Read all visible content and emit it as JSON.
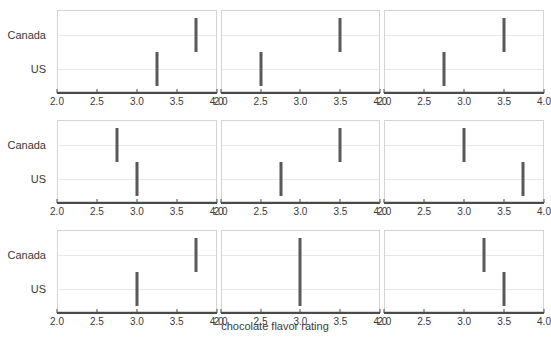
{
  "chart_data": {
    "type": "scatter",
    "title": "",
    "subtitle": "",
    "xlabel": "chocolate flavor rating",
    "ylabel": "",
    "xlim": [
      2.0,
      4.0
    ],
    "xticks": [
      2.0,
      2.5,
      3.0,
      3.5,
      4.0
    ],
    "xtick_labels": [
      "2.0",
      "2.5",
      "3.0",
      "3.5",
      "4.0"
    ],
    "categories": [
      "Canada",
      "US"
    ],
    "grid": true,
    "legend": "none",
    "facet_layout": {
      "rows": 3,
      "cols": 3
    },
    "marker_style": "vertical-interval-bar",
    "marker_color": "#595959",
    "panels": [
      {
        "row": 0,
        "col": 0,
        "values": [
          {
            "category": "Canada",
            "value": 3.75
          },
          {
            "category": "US",
            "value": 3.25
          }
        ]
      },
      {
        "row": 0,
        "col": 1,
        "values": [
          {
            "category": "Canada",
            "value": 3.5
          },
          {
            "category": "US",
            "value": 2.5
          }
        ]
      },
      {
        "row": 0,
        "col": 2,
        "values": [
          {
            "category": "Canada",
            "value": 3.5
          },
          {
            "category": "US",
            "value": 2.75
          }
        ]
      },
      {
        "row": 1,
        "col": 0,
        "values": [
          {
            "category": "Canada",
            "value": 2.75
          },
          {
            "category": "US",
            "value": 3.0
          }
        ]
      },
      {
        "row": 1,
        "col": 1,
        "values": [
          {
            "category": "Canada",
            "value": 3.5
          },
          {
            "category": "US",
            "value": 2.75
          }
        ]
      },
      {
        "row": 1,
        "col": 2,
        "values": [
          {
            "category": "Canada",
            "value": 3.0
          },
          {
            "category": "US",
            "value": 3.75
          }
        ]
      },
      {
        "row": 2,
        "col": 0,
        "values": [
          {
            "category": "Canada",
            "value": 3.75
          },
          {
            "category": "US",
            "value": 3.0
          }
        ]
      },
      {
        "row": 2,
        "col": 1,
        "values": [
          {
            "category": "Canada",
            "value": 3.0
          },
          {
            "category": "US",
            "value": 3.0
          }
        ]
      },
      {
        "row": 2,
        "col": 2,
        "values": [
          {
            "category": "Canada",
            "value": 3.25
          },
          {
            "category": "US",
            "value": 3.5
          }
        ]
      }
    ]
  },
  "axis": {
    "x_title": "chocolate flavor rating"
  },
  "colors": {
    "marker": "#595959",
    "axis_line": "#4a4a4a",
    "panel_border": "#d4d4d4",
    "gridline": "#e8e8e8",
    "text": "#3a3a3a",
    "background": "#ffffff"
  }
}
